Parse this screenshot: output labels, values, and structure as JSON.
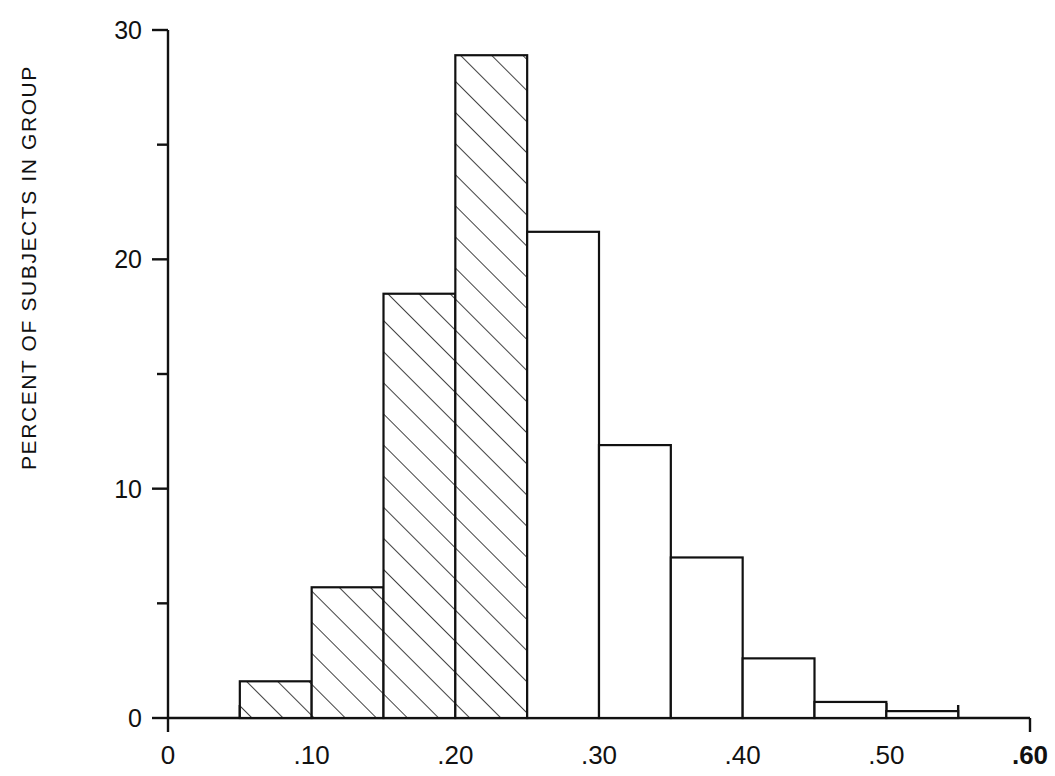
{
  "chart_data": {
    "type": "bar",
    "title": "",
    "subtitle": "",
    "xlabel": "",
    "ylabel": "PERCENT OF SUBJECTS IN GROUP",
    "xlim": [
      0,
      0.6
    ],
    "ylim": [
      0,
      30
    ],
    "grid": false,
    "legend": null,
    "bin_width": 0.05,
    "x_major_ticks": [
      "0",
      ".10",
      ".20",
      ".30",
      ".40",
      ".50",
      ".60"
    ],
    "x_major_tick_values": [
      0,
      0.1,
      0.2,
      0.3,
      0.4,
      0.5,
      0.6
    ],
    "x_minor_tick_values": [
      0.05,
      0.15,
      0.25,
      0.35,
      0.45,
      0.55
    ],
    "y_major_ticks": [
      "0",
      "10",
      "20",
      "30"
    ],
    "y_major_tick_values": [
      0,
      10,
      20,
      30
    ],
    "y_minor_tick_values": [
      5,
      15,
      25
    ],
    "bin_edges": [
      0.05,
      0.1,
      0.15,
      0.2,
      0.25,
      0.3,
      0.35,
      0.4,
      0.45,
      0.5,
      0.55
    ],
    "categories": [
      "0.05-0.10",
      "0.10-0.15",
      "0.15-0.20",
      "0.20-0.25",
      "0.25-0.30",
      "0.30-0.35",
      "0.35-0.40",
      "0.40-0.45",
      "0.45-0.50",
      "0.50-0.55"
    ],
    "values": [
      1.6,
      5.7,
      18.5,
      28.9,
      21.2,
      11.9,
      7.0,
      2.6,
      0.7,
      0.3
    ],
    "bars": [
      {
        "x0": 0.05,
        "x1": 0.1,
        "value": 1.6,
        "fill": "hatched"
      },
      {
        "x0": 0.1,
        "x1": 0.15,
        "value": 5.7,
        "fill": "hatched"
      },
      {
        "x0": 0.15,
        "x1": 0.2,
        "value": 18.5,
        "fill": "hatched"
      },
      {
        "x0": 0.2,
        "x1": 0.25,
        "value": 28.9,
        "fill": "hatched"
      },
      {
        "x0": 0.25,
        "x1": 0.3,
        "value": 21.2,
        "fill": "none"
      },
      {
        "x0": 0.3,
        "x1": 0.35,
        "value": 11.9,
        "fill": "none"
      },
      {
        "x0": 0.35,
        "x1": 0.4,
        "value": 7.0,
        "fill": "none"
      },
      {
        "x0": 0.4,
        "x1": 0.45,
        "value": 2.6,
        "fill": "none"
      },
      {
        "x0": 0.45,
        "x1": 0.5,
        "value": 0.7,
        "fill": "none"
      },
      {
        "x0": 0.5,
        "x1": 0.55,
        "value": 0.3,
        "fill": "none"
      }
    ],
    "bold_tick_labels": [
      ".60"
    ],
    "colors": {
      "axis": "#111111",
      "bar_stroke": "#111111",
      "bar_fill": "#ffffff",
      "hatch": "#111111",
      "background": "#ffffff"
    }
  }
}
